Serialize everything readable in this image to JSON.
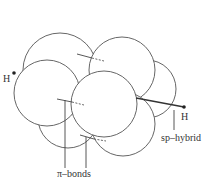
{
  "diagram": {
    "type": "molecular-orbital-overlap",
    "labels": {
      "h_left": "H",
      "h_right": "H",
      "sp_hybrid": "sp–hybrid",
      "pi_bonds": "π–bonds"
    },
    "colors": {
      "stroke": "#555555",
      "fill": "#ffffff",
      "text": "#333333"
    }
  }
}
